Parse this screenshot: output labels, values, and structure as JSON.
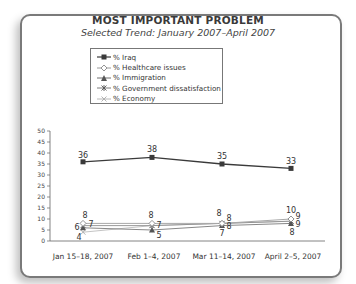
{
  "chart": {
    "title": "MOST IMPORTANT PROBLEM",
    "subtitle": "Selected Trend: January 2007–April 2007",
    "legend": [
      {
        "label": "% Iraq",
        "marker": "filled-square",
        "color": "#3a3a3a"
      },
      {
        "label": "% Healthcare issues",
        "marker": "open-diamond",
        "color": "#9a9a9a"
      },
      {
        "label": "% Immigration",
        "marker": "filled-triangle",
        "color": "#6e6e6e"
      },
      {
        "label": "% Government dissatisfaction",
        "marker": "asterisk",
        "color": "#7d7d7d"
      },
      {
        "label": "% Economy",
        "marker": "x-mark",
        "color": "#b8b8b8"
      }
    ],
    "y_ticks": [
      "50",
      "45",
      "40",
      "35",
      "30",
      "25",
      "20",
      "15",
      "10",
      "5",
      "0"
    ],
    "x_labels": [
      "Jan 15–18, 2007",
      "Feb 1–4, 2007",
      "Mar 11–14, 2007",
      "April 2–5, 2007"
    ]
  },
  "chart_data": {
    "type": "line",
    "title": "MOST IMPORTANT PROBLEM",
    "subtitle": "Selected Trend: January 2007–April 2007",
    "xlabel": "",
    "ylabel": "",
    "categories": [
      "Jan 15–18, 2007",
      "Feb 1–4, 2007",
      "Mar 11–14, 2007",
      "April 2–5, 2007"
    ],
    "ylim": [
      0,
      50
    ],
    "yticks": [
      0,
      5,
      10,
      15,
      20,
      25,
      30,
      35,
      40,
      45,
      50
    ],
    "grid": false,
    "legend_position": "top-center, boxed",
    "series": [
      {
        "name": "% Iraq",
        "values": [
          36,
          38,
          35,
          33
        ]
      },
      {
        "name": "% Healthcare issues",
        "values": [
          8,
          8,
          8,
          10
        ]
      },
      {
        "name": "% Immigration",
        "values": [
          6,
          5,
          7,
          8
        ]
      },
      {
        "name": "% Government dissatisfaction",
        "values": [
          7,
          7,
          8,
          9
        ]
      },
      {
        "name": "% Economy",
        "values": [
          4,
          7,
          8,
          9
        ]
      }
    ],
    "data_labels": {
      "Jan 15–18, 2007": [
        "36",
        "8",
        "7",
        "6",
        "4"
      ],
      "Feb 1–4, 2007": [
        "38",
        "8",
        "7",
        "5"
      ],
      "Mar 11–14, 2007": [
        "35",
        "8",
        "8",
        "8",
        "7"
      ],
      "April 2–5, 2007": [
        "33",
        "10",
        "9",
        "9",
        "8"
      ]
    }
  }
}
